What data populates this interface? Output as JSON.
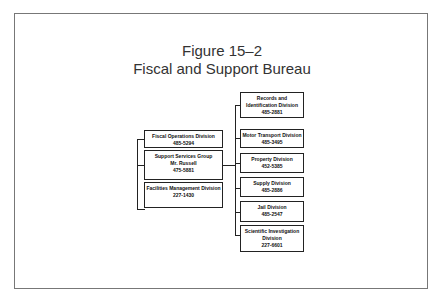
{
  "figure": {
    "label": "Figure 15–2",
    "title": "Fiscal and Support Bureau"
  },
  "left_units": [
    {
      "name": "Fiscal Operations Division",
      "phone": "485-5294"
    },
    {
      "name": "Support Services Group",
      "manager": "Mr. Russell",
      "phone": "475-5881"
    },
    {
      "name": "Facilities Management Division",
      "phone": "227-1430"
    }
  ],
  "right_units": [
    {
      "name": "Records and Identification Division",
      "phone": "485-2881"
    },
    {
      "name": "Motor Transport Division",
      "phone": "485-3495"
    },
    {
      "name": "Property Division",
      "phone": "452-5385"
    },
    {
      "name": "Supply Division",
      "phone": "485-2886"
    },
    {
      "name": "Jail Division",
      "phone": "485-2547"
    },
    {
      "name": "Scientific Investigation Division",
      "phone": "227-6601"
    }
  ]
}
